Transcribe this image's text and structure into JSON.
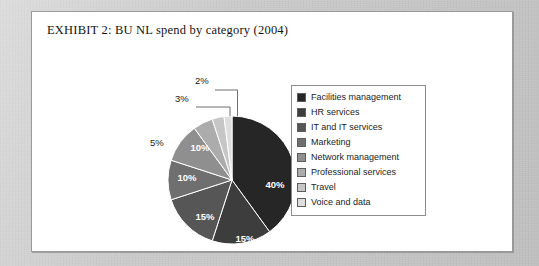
{
  "page": {
    "background_color": "#cbcbcb",
    "card_background": "#ffffff",
    "card_border_color": "#9a9a9a"
  },
  "exhibit": {
    "title": "EXHIBIT 2:  BU NL spend by category (2004)"
  },
  "chart_data": {
    "type": "pie",
    "title": "EXHIBIT 2:  BU NL spend by category (2004)",
    "xlabel": "",
    "ylabel": "",
    "units": "percent",
    "legend_position": "right",
    "grid": false,
    "start_angle_deg": 0,
    "direction": "clockwise",
    "categories": [
      "Facilities management",
      "HR services",
      "IT and IT services",
      "Marketing",
      "Network management",
      "Professional services",
      "Travel",
      "Voice and data"
    ],
    "values": [
      40,
      15,
      15,
      10,
      10,
      5,
      3,
      2
    ],
    "labels": [
      "40%",
      "15%",
      "15%",
      "10%",
      "10%",
      "5%",
      "3%",
      "2%"
    ],
    "colors": [
      "#262626",
      "#3d3d3d",
      "#565656",
      "#6f6f6f",
      "#8f8f8f",
      "#acacac",
      "#c6c6c6",
      "#dedede"
    ],
    "label_placement": [
      "inside",
      "inside",
      "inside",
      "inside",
      "inside",
      "outside",
      "outside-leader",
      "outside-leader"
    ]
  },
  "legend": {
    "items": [
      {
        "label": "Facilities management",
        "color": "#262626",
        "value": "40%"
      },
      {
        "label": "HR services",
        "color": "#3d3d3d",
        "value": "15%"
      },
      {
        "label": "IT and IT services",
        "color": "#565656",
        "value": "15%"
      },
      {
        "label": "Marketing",
        "color": "#6f6f6f",
        "value": "10%"
      },
      {
        "label": "Network management",
        "color": "#8f8f8f",
        "value": "10%"
      },
      {
        "label": "Professional services",
        "color": "#acacac",
        "value": "5%"
      },
      {
        "label": "Travel",
        "color": "#c6c6c6",
        "value": "3%"
      },
      {
        "label": "Voice and data",
        "color": "#dedede",
        "value": "2%"
      }
    ]
  },
  "pie_labels": {
    "inside": [
      {
        "text": "40%",
        "x": 138,
        "y": 124
      },
      {
        "text": "15%",
        "x": 108,
        "y": 178
      },
      {
        "text": "15%",
        "x": 68,
        "y": 156
      },
      {
        "text": "10%",
        "x": 50,
        "y": 117
      },
      {
        "text": "10%",
        "x": 63,
        "y": 87
      }
    ],
    "outside": [
      {
        "text": "5%",
        "x": 13,
        "y": 82
      },
      {
        "text": "3%",
        "x": 38,
        "y": 38
      },
      {
        "text": "2%",
        "x": 58,
        "y": 20
      }
    ]
  }
}
